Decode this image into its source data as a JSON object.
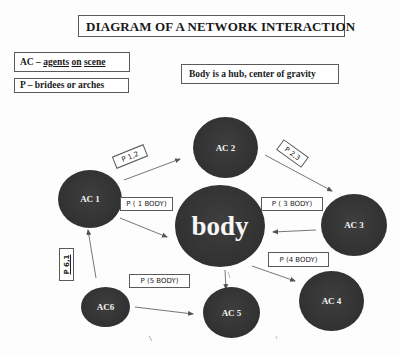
{
  "title": {
    "text": "DIAGRAM OF A NETWORK INTERACTION"
  },
  "legend": {
    "ac": {
      "prefix": "AC – ",
      "word1": "agents",
      "space1": " ",
      "word2": "on",
      "space2": " ",
      "word3": "scene"
    },
    "p": {
      "text": "P – bridees or arches"
    }
  },
  "note": {
    "text": "Body is a hub, center of gravity"
  },
  "nodes": {
    "ac1": {
      "label": "AC 1"
    },
    "ac2": {
      "label": "AC 2"
    },
    "hub": {
      "label": "body"
    },
    "ac3": {
      "label": "AC 3"
    },
    "ac4": {
      "label": "AC 4"
    },
    "ac5": {
      "label": "AC 5"
    },
    "ac6": {
      "label": "AC6"
    }
  },
  "bridges": {
    "p12": {
      "label": "P 1,2"
    },
    "p1body": {
      "label": "P ( 1 BODY)"
    },
    "p23": {
      "label": "P 2,3"
    },
    "p3body": {
      "label": "P ( 3 BODY)"
    },
    "p4body": {
      "label": "P (4 BODY)"
    },
    "p5body": {
      "label": "P (5 BODY)"
    },
    "p61": {
      "label": "P 6,1"
    }
  },
  "edges": [
    {
      "from": "AC 1",
      "to": "AC 2",
      "label": "P 1,2"
    },
    {
      "from": "AC 1",
      "to": "body",
      "label": "P ( 1 BODY)"
    },
    {
      "from": "AC 2",
      "to": "AC 3",
      "label": "P 2,3"
    },
    {
      "from": "AC 3",
      "to": "body",
      "label": "P ( 3 BODY)"
    },
    {
      "from": "body",
      "to": "AC 4",
      "label": "P (4 BODY)"
    },
    {
      "from": "body",
      "to": "AC 5",
      "label": ""
    },
    {
      "from": "AC6",
      "to": "AC 5",
      "label": "P (5 BODY)"
    },
    {
      "from": "AC6",
      "to": "AC 1",
      "label": "P 6,1"
    }
  ],
  "colors": {
    "node_fill": "#333333",
    "node_text": "#f4f4f4",
    "line": "#555555",
    "box_border": "#5a5a5a"
  }
}
